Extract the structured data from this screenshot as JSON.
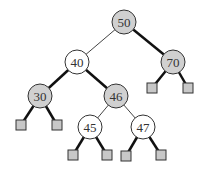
{
  "diagram": {
    "type": "binary-search-tree",
    "colors": {
      "shaded_node": "#d0d0d0",
      "white_node": "#ffffff",
      "stroke": "#333333",
      "leaf": "#c8c8c8",
      "thick_edge": "#111111",
      "thin_edge": "#444444"
    },
    "nodes": [
      {
        "id": "n50",
        "label": "50",
        "x": 124,
        "y": 22,
        "shaded": true
      },
      {
        "id": "n40",
        "label": "40",
        "x": 77,
        "y": 62,
        "shaded": false
      },
      {
        "id": "n70",
        "label": "70",
        "x": 173,
        "y": 62,
        "shaded": true
      },
      {
        "id": "n30",
        "label": "30",
        "x": 40,
        "y": 96,
        "shaded": true
      },
      {
        "id": "n46",
        "label": "46",
        "x": 116,
        "y": 96,
        "shaded": true
      },
      {
        "id": "n45",
        "label": "45",
        "x": 90,
        "y": 127,
        "shaded": false
      },
      {
        "id": "n47",
        "label": "47",
        "x": 143,
        "y": 127,
        "shaded": false
      }
    ],
    "leaves": [
      {
        "id": "l30a",
        "x": 21,
        "y": 125
      },
      {
        "id": "l30b",
        "x": 57,
        "y": 125
      },
      {
        "id": "l70a",
        "x": 152,
        "y": 88
      },
      {
        "id": "l70b",
        "x": 188,
        "y": 88
      },
      {
        "id": "l45a",
        "x": 73,
        "y": 155
      },
      {
        "id": "l45b",
        "x": 107,
        "y": 155
      },
      {
        "id": "l47a",
        "x": 126,
        "y": 156
      },
      {
        "id": "l47b",
        "x": 161,
        "y": 155
      }
    ]
  }
}
